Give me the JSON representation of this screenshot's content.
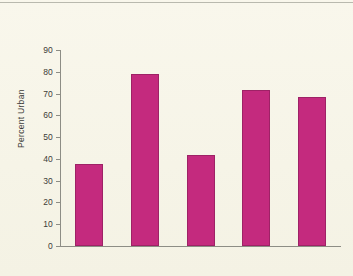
{
  "chart_data": {
    "type": "bar",
    "title": "",
    "xlabel": "",
    "ylabel": "Percent Urban",
    "categories": [
      "Africa",
      "Americas",
      "Asia",
      "Europe",
      "Oceania"
    ],
    "values": [
      37.5,
      79,
      42,
      71.5,
      68.5
    ],
    "ylim": [
      0,
      90
    ],
    "ytick_labels": [
      "0",
      "10",
      "20",
      "30",
      "40",
      "50",
      "60",
      "70",
      "80",
      "90"
    ],
    "ytick_values": [
      0,
      10,
      20,
      30,
      40,
      50,
      60,
      70,
      80,
      90
    ],
    "grid": false,
    "legend": null,
    "bar_color": "#c42a7e",
    "bar_edge_color": "#9e2266",
    "axis_color": "#8d8d85",
    "background_color": "#f7f5e9",
    "text_color": "#3c3c38"
  }
}
